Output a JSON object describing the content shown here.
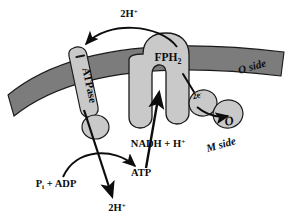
{
  "figure": {
    "colors": {
      "membrane": "#7c7c7c",
      "membrane_edge": "#1a1a1a",
      "protein_fill": "#c9c9c9",
      "protein_edge": "#1a1a1a",
      "background": "#ffffff",
      "ink": "#0d0d0d"
    }
  },
  "labels": {
    "proton_top": {
      "text": "2H",
      "charge": "+"
    },
    "atpase": {
      "text": "ATPase"
    },
    "fph2": {
      "text": "FPH",
      "subscript": "2"
    },
    "o_side": {
      "text": "O side"
    },
    "m_side": {
      "text": "M side"
    },
    "two_electrons": {
      "text": "2e",
      "charge": "-"
    },
    "oxygen": {
      "text": "O"
    },
    "nadh": {
      "text": "NADH + H",
      "charge": "+"
    },
    "pi_adp": {
      "text": "P",
      "subscript": "i",
      "rest": " + ADP"
    },
    "atp": {
      "text": "ATP"
    },
    "proton_bottom": {
      "text": "2H",
      "charge": "+"
    }
  },
  "arrows": {
    "proton_arc": "curved arrow from FPH2 region over the membrane to the ATPase, carrying 2H+",
    "nadh_into_fph2": "straight arrow from NADH + H+ upward into the FPH2 channel",
    "electron_transfer": "arrow from 2e- carrier to O",
    "fph2_to_electron": "short line linking FPH2 to the 2e- carrier",
    "proton_through_atpase": "straight arrow down through the ATPase to 2H+",
    "phosphorylation": "curved arrow from Pi + ADP to ATP"
  }
}
